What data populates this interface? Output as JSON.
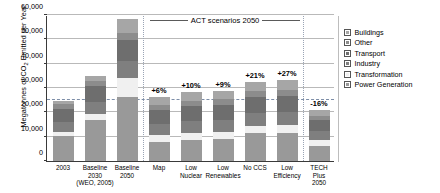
{
  "chart_data": {
    "type": "bar",
    "stacked": true,
    "title": "",
    "xlabel": "",
    "ylabel": "Megatonnes of CO2 Emitted per Year",
    "ylabel_main": "Megatonnes of CO",
    "ylabel_sub": "2",
    "ylabel_tail": " Emitted per Year",
    "ylim": [
      0,
      60000
    ],
    "ytick_step": 10000,
    "ytick_labels": [
      "0",
      "10,000",
      "20,000",
      "30,000",
      "40,000",
      "50,000",
      "60,000"
    ],
    "ytick_values": [
      0,
      10000,
      20000,
      30000,
      40000,
      50000,
      60000
    ],
    "grid": true,
    "legend_position": "right",
    "categories": [
      "2003",
      "Baseline 2030 (WEO, 2005)",
      "Baseline 2050",
      "Map",
      "Low Nuclear",
      "Low Renewables",
      "No CCS",
      "Low Efficiency",
      "TECH Plus 2050"
    ],
    "category_lines": [
      [
        "2003"
      ],
      [
        "Baseline",
        "2030",
        "(WEO, 2005)"
      ],
      [
        "Baseline",
        "2050"
      ],
      [
        "Map"
      ],
      [
        "Low",
        "Nuclear"
      ],
      [
        "Low",
        "Renewables"
      ],
      [
        "No CCS"
      ],
      [
        "Low",
        "Efficiency"
      ],
      [
        "TECH",
        "Plus",
        "2050"
      ]
    ],
    "series": [
      {
        "name": "Power Generation",
        "color": "#999999",
        "values": [
          10200,
          17000,
          26500,
          7800,
          8700,
          9000,
          11500,
          11600,
          6300
        ]
      },
      {
        "name": "Transformation",
        "color": "#f0f0f0",
        "values": [
          1600,
          2200,
          7800,
          3100,
          3000,
          2900,
          3000,
          3000,
          2300
        ]
      },
      {
        "name": "Industry",
        "color": "#7f7f7f",
        "values": [
          4400,
          5000,
          6800,
          4500,
          4900,
          5100,
          5200,
          5400,
          3900
        ]
      },
      {
        "name": "Transport",
        "color": "#6e6e6e",
        "values": [
          5200,
          6500,
          8500,
          5500,
          5900,
          6100,
          6600,
          6900,
          4400
        ]
      },
      {
        "name": "Other",
        "color": "#8c8c8c",
        "values": [
          1900,
          2300,
          3200,
          2000,
          2100,
          2200,
          2400,
          2500,
          1700
        ]
      },
      {
        "name": "Buildings",
        "color": "#a6a6a6",
        "values": [
          1400,
          1800,
          5400,
          3400,
          3600,
          3600,
          3800,
          4000,
          2400
        ]
      }
    ],
    "totals": [
      24700,
      34800,
      58200,
      26300,
      28200,
      28900,
      32500,
      33400,
      21000
    ],
    "reference_line": {
      "value": 25000,
      "style": "dashed",
      "color": "#7d8ea8"
    },
    "annotations": [
      {
        "text": "ACT scenarios 2050",
        "type": "bracket-label"
      },
      {
        "category": "Map",
        "text": "+6%"
      },
      {
        "category": "Low Nuclear",
        "text": "+10%"
      },
      {
        "category": "Low Renewables",
        "text": "+9%"
      },
      {
        "category": "No CCS",
        "text": "+21%"
      },
      {
        "category": "Low Efficiency",
        "text": "+27%"
      },
      {
        "category": "TECH Plus 2050",
        "text": "-16%"
      }
    ],
    "legend": [
      {
        "label": "Buildings",
        "color": "#a6a6a6"
      },
      {
        "label": "Other",
        "color": "#8c8c8c"
      },
      {
        "label": "Transport",
        "color": "#6e6e6e"
      },
      {
        "label": "Industry",
        "color": "#7f7f7f"
      },
      {
        "label": "Transformation",
        "color": "#f0f0f0"
      },
      {
        "label": "Power Generation",
        "color": "#999999"
      }
    ]
  }
}
